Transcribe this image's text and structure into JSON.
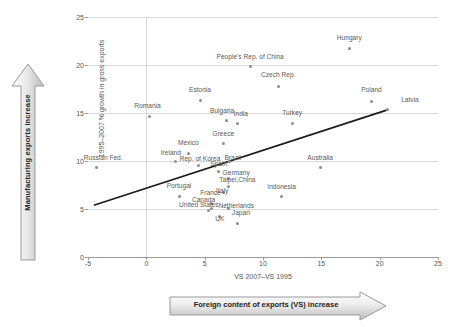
{
  "annotations": {
    "vertical_arrow_label": "Manufacturing exports increase",
    "horizontal_arrow_label": "Foreign content of exports (VS) increase"
  },
  "chart_data": {
    "type": "scatter",
    "title": "",
    "xlabel": "VS 2007–VS 1995",
    "ylabel": "1995–2007 % growth in gross exports",
    "xlim": [
      -5,
      25
    ],
    "ylim": [
      0,
      25
    ],
    "xticks": [
      -5,
      0,
      5,
      10,
      15,
      20,
      25
    ],
    "yticks": [
      0,
      5,
      10,
      15,
      20,
      25
    ],
    "grid": true,
    "legend": "none",
    "marker_color": "#8d8d8d",
    "grid_color": "#d8d8d8",
    "trendline": {
      "visible": true,
      "color": "#1a1a1a",
      "x0": -4.5,
      "y0": 5.4,
      "x1": 20.6,
      "y1": 15.3
    },
    "points": [
      {
        "label": "Hungary",
        "x": 17.4,
        "y": 21.7,
        "lx": 17.4,
        "ly": 22.9
      },
      {
        "label": "People's Rep. of China",
        "x": 8.9,
        "y": 19.8,
        "lx": 8.9,
        "ly": 20.9
      },
      {
        "label": "Czech Rep.",
        "x": 11.3,
        "y": 17.8,
        "lx": 11.3,
        "ly": 19.0
      },
      {
        "label": "Estonia",
        "x": 4.6,
        "y": 16.3,
        "lx": 4.6,
        "ly": 17.5
      },
      {
        "label": "Poland",
        "x": 19.3,
        "y": 16.2,
        "lx": 19.3,
        "ly": 17.4
      },
      {
        "label": "Latvia",
        "x": 20.7,
        "y": 15.4,
        "lx": 22.6,
        "ly": 16.4
      },
      {
        "label": "Romania",
        "x": 0.3,
        "y": 14.6,
        "lx": 0.1,
        "ly": 15.8
      },
      {
        "label": "Bulgaria",
        "x": 6.9,
        "y": 14.2,
        "lx": 6.5,
        "ly": 15.3
      },
      {
        "label": "India",
        "x": 7.8,
        "y": 13.9,
        "lx": 8.1,
        "ly": 14.9
      },
      {
        "label": "Turkey",
        "x": 12.5,
        "y": 13.9,
        "lx": 12.5,
        "ly": 15.1
      },
      {
        "label": "Greece",
        "x": 6.6,
        "y": 11.8,
        "lx": 6.6,
        "ly": 12.9
      },
      {
        "label": "Mexico",
        "x": 3.6,
        "y": 10.8,
        "lx": 3.6,
        "ly": 11.9
      },
      {
        "label": "Ireland",
        "x": 2.5,
        "y": 9.9,
        "lx": 2.1,
        "ly": 10.9
      },
      {
        "label": "Rep. of Korea",
        "x": 4.5,
        "y": 9.5,
        "lx": 4.6,
        "ly": 10.3
      },
      {
        "label": "Brazil",
        "x": 7.1,
        "y": 9.9,
        "lx": 7.4,
        "ly": 10.4
      },
      {
        "label": "Spain",
        "x": 6.2,
        "y": 8.9,
        "lx": 6.2,
        "ly": 9.7
      },
      {
        "label": "Australia",
        "x": 14.9,
        "y": 9.3,
        "lx": 14.9,
        "ly": 10.4
      },
      {
        "label": "Germany",
        "x": 7.0,
        "y": 8.2,
        "lx": 7.7,
        "ly": 8.8
      },
      {
        "label": "Taipei,China",
        "x": 7.0,
        "y": 7.3,
        "lx": 7.8,
        "ly": 8.1
      },
      {
        "label": "Indonesia",
        "x": 11.6,
        "y": 6.3,
        "lx": 11.6,
        "ly": 7.3
      },
      {
        "label": "Portugal",
        "x": 2.8,
        "y": 6.3,
        "lx": 2.8,
        "ly": 7.4
      },
      {
        "label": "Italy",
        "x": 6.6,
        "y": 6.7,
        "lx": 6.5,
        "ly": 6.9
      },
      {
        "label": "France",
        "x": 5.6,
        "y": 5.6,
        "lx": 5.5,
        "ly": 6.7
      },
      {
        "label": "Canada",
        "x": 5.3,
        "y": 4.8,
        "lx": 4.9,
        "ly": 6.0
      },
      {
        "label": "United States",
        "x": 5.6,
        "y": 5.1,
        "lx": 4.5,
        "ly": 5.5
      },
      {
        "label": "Netherlands",
        "x": 7.0,
        "y": 5.1,
        "lx": 7.7,
        "ly": 5.4
      },
      {
        "label": "Japan",
        "x": 7.8,
        "y": 3.5,
        "lx": 8.1,
        "ly": 4.6
      },
      {
        "label": "UK",
        "x": 6.3,
        "y": 4.2,
        "lx": 6.3,
        "ly": 4.0
      },
      {
        "label": "Russian Fed.",
        "x": -4.3,
        "y": 9.3,
        "lx": -3.7,
        "ly": 10.4
      }
    ]
  }
}
